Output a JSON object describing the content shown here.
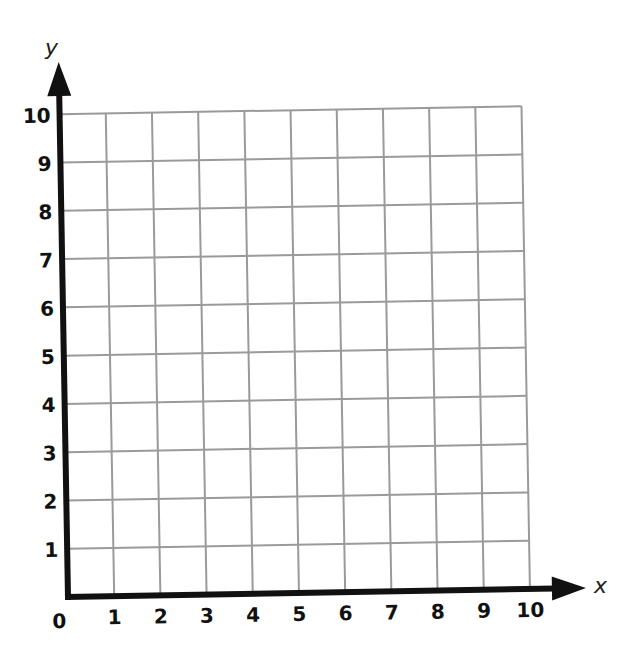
{
  "chart_data": {
    "type": "scatter",
    "title": "",
    "xlabel": "x",
    "ylabel": "y",
    "xlim": [
      0,
      10
    ],
    "ylim": [
      0,
      10
    ],
    "grid": true,
    "x_ticks": [
      "1",
      "2",
      "3",
      "4",
      "5",
      "6",
      "7",
      "8",
      "9",
      "10"
    ],
    "y_ticks": [
      "1",
      "2",
      "3",
      "4",
      "5",
      "6",
      "7",
      "8",
      "9",
      "10"
    ],
    "origin_label": "0",
    "series": []
  },
  "colors": {
    "grid": "#9a9a9a",
    "axis": "#111111"
  }
}
